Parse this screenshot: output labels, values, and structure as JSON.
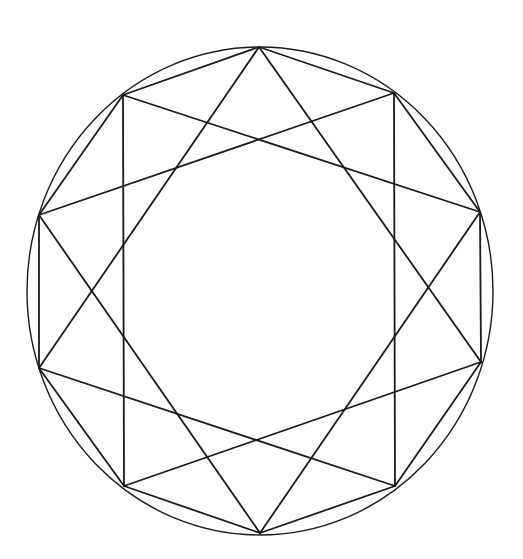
{
  "figure": {
    "stroke_color": "#1a1a1a",
    "background": "#ffffff",
    "circle": {
      "cx": 260,
      "cy": 291,
      "rx": 233,
      "ry": 244
    },
    "vertices": [
      [
        259,
        47
      ],
      [
        123,
        95
      ],
      [
        39,
        215
      ],
      [
        39,
        368
      ],
      [
        124,
        486
      ],
      [
        260,
        533
      ],
      [
        395,
        486
      ],
      [
        481,
        362
      ],
      [
        480,
        212
      ],
      [
        394,
        93
      ]
    ],
    "star_step": 3
  }
}
